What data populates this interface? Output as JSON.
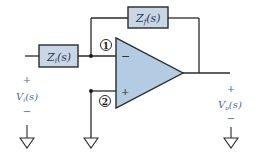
{
  "diagram": {
    "type": "inverting op-amp circuit",
    "components": {
      "input_impedance": {
        "label": "Z",
        "subscript": "i",
        "arg": "(s)"
      },
      "feedback_impedance": {
        "label": "Z",
        "subscript": "f",
        "arg": "(s)"
      },
      "opamp": {
        "inverting": "−",
        "noninverting": "+"
      }
    },
    "nodes": {
      "node1": "1",
      "node2": "2"
    },
    "input": {
      "plus": "+",
      "label": "V",
      "subscript": "i",
      "arg": "(s)",
      "minus": "−"
    },
    "output": {
      "plus": "+",
      "label": "V",
      "subscript": "o",
      "arg": "(s)",
      "minus": "−"
    },
    "colors": {
      "wire": "#2a2a2a",
      "box_fill": "#c9d6e6",
      "opamp_fill": "#b3cbe3",
      "text_blue": "#4a6a9c"
    }
  }
}
